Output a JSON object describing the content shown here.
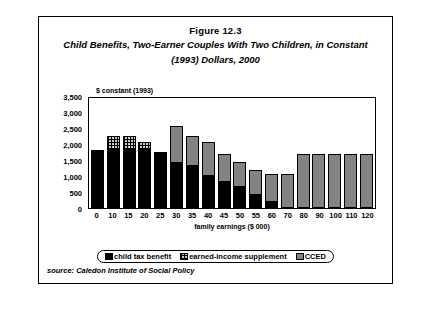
{
  "figure": {
    "number": "Figure 12.3",
    "title_line1": "Child Benefits, Two-Earner Couples With Two Children, in Constant",
    "title_line2": "(1993) Dollars,  2000",
    "source": "source: Caledon Institute of Social Policy"
  },
  "legend": {
    "items": [
      {
        "label": "child tax benefit",
        "key": "child_tax_benefit",
        "color": "#000000",
        "pattern": "solid-black"
      },
      {
        "label": "earned-income supplement",
        "key": "earned_income_supplement",
        "color": "#c9c9c9",
        "pattern": "cross-hatch"
      },
      {
        "label": "CCED",
        "key": "cced",
        "color": "#838383",
        "pattern": "solid-gray"
      }
    ]
  },
  "chart_data": {
    "type": "bar",
    "stacked": true,
    "title": "Child Benefits, Two-Earner Couples With Two Children, in Constant (1993) Dollars, 2000",
    "xlabel": "family earnings ($ 000)",
    "ylabel": "$ constant (1993)",
    "ylim": [
      0,
      3500
    ],
    "yticks": [
      "0",
      "500",
      "1,000",
      "1,500",
      "2,000",
      "2,500",
      "3,000",
      "3,500"
    ],
    "ytick_values": [
      0,
      500,
      1000,
      1500,
      2000,
      2500,
      3000,
      3500
    ],
    "grid": false,
    "legend_position": "bottom",
    "categories": [
      "0",
      "10",
      "15",
      "20",
      "25",
      "30",
      "35",
      "40",
      "45",
      "50",
      "55",
      "60",
      "70",
      "80",
      "90",
      "100",
      "110",
      "120"
    ],
    "series": [
      {
        "name": "child tax benefit",
        "color": "#000000",
        "values": [
          1800,
          1800,
          1800,
          1800,
          1750,
          1400,
          1300,
          1000,
          800,
          650,
          400,
          200,
          0,
          0,
          0,
          0,
          0,
          0
        ]
      },
      {
        "name": "earned-income supplement",
        "color": "#c9c9c9",
        "values": [
          0,
          450,
          450,
          250,
          0,
          0,
          0,
          0,
          0,
          0,
          0,
          0,
          0,
          0,
          0,
          0,
          0,
          0
        ]
      },
      {
        "name": "CCED",
        "color": "#838383",
        "values": [
          0,
          0,
          0,
          0,
          0,
          1150,
          950,
          1050,
          900,
          800,
          800,
          850,
          1050,
          1700,
          1700,
          1700,
          1700,
          1700
        ]
      }
    ],
    "totals": [
      1800,
      2250,
      2250,
      2050,
      1750,
      2550,
      2250,
      2050,
      1700,
      1450,
      1200,
      1050,
      1050,
      1700,
      1700,
      1700,
      1700,
      1700
    ]
  }
}
